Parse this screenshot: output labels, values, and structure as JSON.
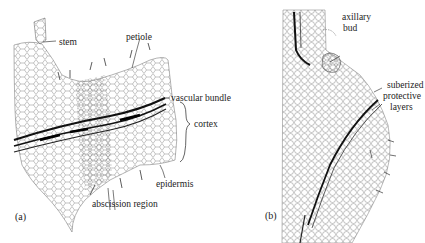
{
  "figure": {
    "panels": [
      {
        "id": "a",
        "marker": "(a)",
        "labels": {
          "stem": "stem",
          "petiole": "petiole",
          "vascular_bundle": "vascular bundle",
          "cortex": "cortex",
          "epidermis": "epidermis",
          "abscission_region": "abscission region"
        }
      },
      {
        "id": "b",
        "marker": "(b)",
        "labels": {
          "axillary_bud_line1": "axillary",
          "axillary_bud_line2": "bud",
          "suberized_line1": "suberized",
          "suberized_line2": "protective",
          "suberized_line3": "layers"
        }
      }
    ],
    "colors": {
      "ink": "#1c1c1c",
      "cell_line": "#6a6a6a",
      "background": "#ffffff"
    }
  }
}
